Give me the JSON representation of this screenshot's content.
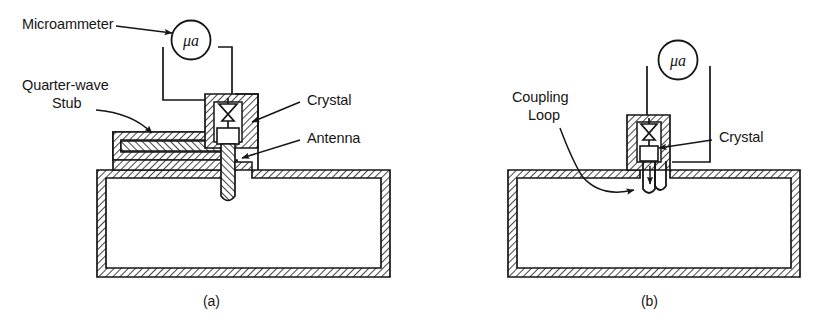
{
  "figure": {
    "background_color": "#ffffff",
    "line_color": "#161616"
  },
  "panels": [
    {
      "id": "a",
      "caption": "(a)",
      "description": "Probe (antenna) coupled crystal detector with quarter-wave stub",
      "meter": {
        "symbol": "μa",
        "name": "microammeter-symbol"
      },
      "labels": [
        {
          "name": "microammeter",
          "text": "Microammeter",
          "lines": [
            "Microammeter"
          ]
        },
        {
          "name": "quarter-wave-stub",
          "text": "Quarter-wave Stub",
          "lines": [
            "Quarter-wave",
            "Stub"
          ]
        },
        {
          "name": "crystal",
          "text": "Crystal",
          "lines": [
            "Crystal"
          ]
        },
        {
          "name": "antenna",
          "text": "Antenna",
          "lines": [
            "Antenna"
          ]
        }
      ]
    },
    {
      "id": "b",
      "caption": "(b)",
      "description": "Loop coupled crystal detector",
      "meter": {
        "symbol": "μa",
        "name": "microammeter-symbol"
      },
      "labels": [
        {
          "name": "coupling-loop",
          "text": "Coupling Loop",
          "lines": [
            "Coupling",
            "Loop"
          ]
        },
        {
          "name": "crystal",
          "text": "Crystal",
          "lines": [
            "Crystal"
          ]
        }
      ]
    }
  ],
  "text": {
    "microammeter": "Microammeter",
    "quarter_wave_line1": "Quarter-wave",
    "quarter_wave_line2": "Stub",
    "crystal_a": "Crystal",
    "antenna": "Antenna",
    "coupling_line1": "Coupling",
    "coupling_line2": "Loop",
    "crystal_b": "Crystal",
    "meter_a": "μa",
    "meter_b": "μa",
    "caption_a": "(a)",
    "caption_b": "(b)"
  }
}
